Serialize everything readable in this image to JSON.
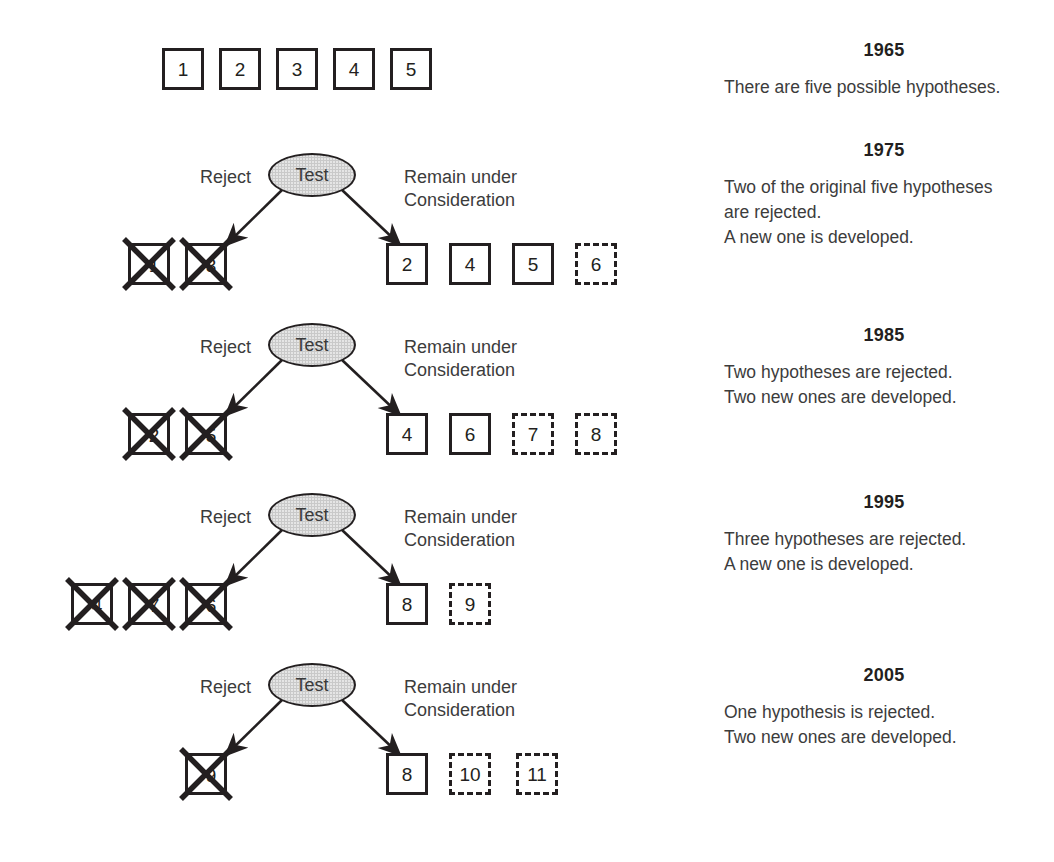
{
  "diagram": {
    "title_text": "Hypothesis testing over time",
    "initial_row": {
      "label": "initial-hypotheses",
      "boxes": [
        {
          "label": "1",
          "style": "solid"
        },
        {
          "label": "2",
          "style": "solid"
        },
        {
          "label": "3",
          "style": "solid"
        },
        {
          "label": "4",
          "style": "solid"
        },
        {
          "label": "5",
          "style": "solid"
        }
      ]
    },
    "test_node_label": "Test",
    "reject_label": "Reject",
    "remain_label": "Remain under\nConsideration",
    "stages": [
      {
        "name": "stage-1975",
        "rejected": [
          {
            "label": "1",
            "style": "solid",
            "crossed": true
          },
          {
            "label": "3",
            "style": "solid",
            "crossed": true
          }
        ],
        "remaining": [
          {
            "label": "2",
            "style": "solid"
          },
          {
            "label": "4",
            "style": "solid"
          },
          {
            "label": "5",
            "style": "solid"
          },
          {
            "label": "6",
            "style": "dashed"
          }
        ]
      },
      {
        "name": "stage-1985",
        "rejected": [
          {
            "label": "2",
            "style": "solid",
            "crossed": true
          },
          {
            "label": "5",
            "style": "solid",
            "crossed": true
          }
        ],
        "remaining": [
          {
            "label": "4",
            "style": "solid"
          },
          {
            "label": "6",
            "style": "solid"
          },
          {
            "label": "7",
            "style": "dashed"
          },
          {
            "label": "8",
            "style": "dashed"
          }
        ]
      },
      {
        "name": "stage-1995",
        "rejected": [
          {
            "label": "4",
            "style": "solid",
            "crossed": true
          },
          {
            "label": "7",
            "style": "solid",
            "crossed": true
          },
          {
            "label": "6",
            "style": "solid",
            "crossed": true
          }
        ],
        "remaining": [
          {
            "label": "8",
            "style": "solid"
          },
          {
            "label": "9",
            "style": "dashed"
          }
        ]
      },
      {
        "name": "stage-2005",
        "rejected": [
          {
            "label": "9",
            "style": "solid",
            "crossed": true
          }
        ],
        "remaining": [
          {
            "label": "8",
            "style": "solid"
          },
          {
            "label": "10",
            "style": "dashed"
          },
          {
            "label": "11",
            "style": "dashed"
          }
        ]
      }
    ]
  },
  "notes": [
    {
      "year": "1965",
      "body": "There are five possible hypotheses."
    },
    {
      "year": "1975",
      "body": "Two of the original five hypotheses\nare rejected.\nA new one is developed."
    },
    {
      "year": "1985",
      "body": "Two hypotheses are rejected.\nTwo new ones are developed."
    },
    {
      "year": "1995",
      "body": "Three hypotheses are rejected.\nA new one is developed."
    },
    {
      "year": "2005",
      "body": "One hypothesis is rejected.\nTwo new ones are developed."
    }
  ],
  "colors": {
    "ink": "#231f20",
    "text": "#3c3c3c",
    "node_fill": "#c9c9c9",
    "background": "#ffffff"
  }
}
